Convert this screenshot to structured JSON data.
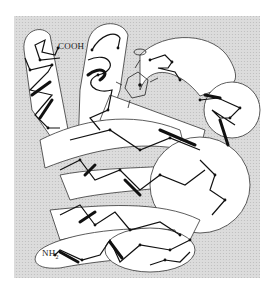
{
  "figure": {
    "background_color": "#d9d9d9",
    "tube_fill": "#ffffff",
    "chain_color": "#111111",
    "labels": {
      "c_terminus": "COOH",
      "n_terminus": "NH",
      "n_terminus_sub": "2"
    }
  }
}
